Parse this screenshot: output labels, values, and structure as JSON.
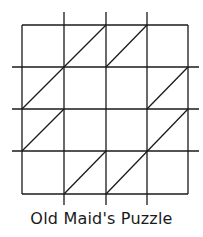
{
  "diagram": {
    "title": "Old Maid's Puzzle",
    "line_color": "#1a1a1a",
    "grid": {
      "cols": 4,
      "rows": 4,
      "x_lines": [
        22,
        64,
        106,
        147,
        188
      ],
      "y_lines": [
        25,
        67,
        109,
        151,
        194
      ],
      "extend_min": 12,
      "extend_max_x": 199,
      "extend_max_y": 205
    },
    "diagonals": [
      {
        "x1": 22,
        "y1": 109,
        "x2": 106,
        "y2": 25
      },
      {
        "x1": 106,
        "y1": 67,
        "x2": 147,
        "y2": 25
      },
      {
        "x1": 147,
        "y1": 109,
        "x2": 188,
        "y2": 67
      },
      {
        "x1": 22,
        "y1": 151,
        "x2": 64,
        "y2": 109
      },
      {
        "x1": 64,
        "y1": 194,
        "x2": 106,
        "y2": 151
      },
      {
        "x1": 106,
        "y1": 194,
        "x2": 188,
        "y2": 109
      }
    ]
  }
}
